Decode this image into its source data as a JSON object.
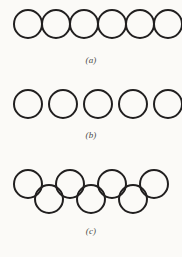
{
  "figure": {
    "background_color": "#fbfaf7",
    "stroke_color": "#211f1f",
    "stroke_width": 2,
    "width": 182,
    "height": 257,
    "panels": [
      {
        "id": "a",
        "label": "(a)",
        "description": "six mutually tangent circles in a single horizontal row",
        "arrangement": "tangent-row",
        "circle_count": 6,
        "radius": 14,
        "rows": [
          {
            "row_index": 0,
            "cy": 18,
            "centers_x": [
              28,
              56,
              84,
              112,
              140,
              168
            ]
          }
        ]
      },
      {
        "id": "b",
        "label": "(b)",
        "description": "five separated circles in a single horizontal row with equal gaps",
        "arrangement": "spaced-row",
        "circle_count": 5,
        "radius": 14,
        "rows": [
          {
            "row_index": 0,
            "cy": 18,
            "centers_x": [
              28,
              63,
              98,
              133,
              168
            ]
          }
        ]
      },
      {
        "id": "c",
        "label": "(c)",
        "description": "interlocking two-row arrangement: four circles above, three circles below, offset and overlapping",
        "arrangement": "interlocking-two-row",
        "circle_count": 7,
        "radius": 14,
        "rows": [
          {
            "row_index": 0,
            "cy": 18,
            "centers_x": [
              28,
              70,
              112,
              154
            ]
          },
          {
            "row_index": 1,
            "cy": 33,
            "centers_x": [
              49,
              91,
              133
            ]
          }
        ]
      }
    ]
  }
}
